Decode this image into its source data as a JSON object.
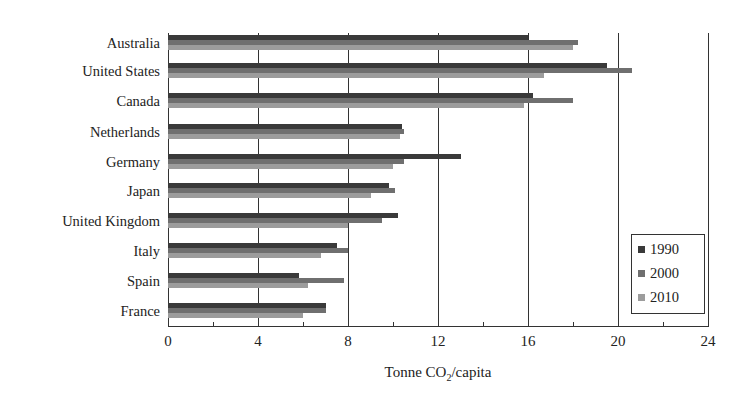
{
  "chart_data": {
    "type": "bar",
    "orientation": "horizontal",
    "title": "",
    "xlabel": "Tonne CO2/capita",
    "ylabel": "",
    "xlim": [
      0,
      24
    ],
    "xticks": [
      0,
      4,
      8,
      12,
      16,
      20,
      24
    ],
    "grid": "vertical",
    "legend_position": "lower right",
    "categories": [
      "Australia",
      "United States",
      "Canada",
      "Netherlands",
      "Germany",
      "Japan",
      "United Kingdom",
      "Italy",
      "Spain",
      "France"
    ],
    "series": [
      {
        "name": "1990",
        "color": "#3a3a3a",
        "values": [
          16.0,
          19.5,
          16.2,
          10.4,
          13.0,
          9.8,
          10.2,
          7.5,
          5.8,
          7.0
        ]
      },
      {
        "name": "2000",
        "color": "#6f6f6f",
        "values": [
          18.2,
          20.6,
          18.0,
          10.5,
          10.5,
          10.1,
          9.5,
          8.0,
          7.8,
          7.0
        ]
      },
      {
        "name": "2010",
        "color": "#9c9c9c",
        "values": [
          18.0,
          16.7,
          15.8,
          10.3,
          10.0,
          9.0,
          8.0,
          6.8,
          6.2,
          6.0
        ]
      }
    ]
  },
  "axis": {
    "xlabel_main": "Tonne CO",
    "xlabel_sub": "2",
    "xlabel_tail": "/capita",
    "ticks": [
      "0",
      "4",
      "8",
      "12",
      "16",
      "20",
      "24"
    ]
  },
  "legend": {
    "items": [
      "1990",
      "2000",
      "2010"
    ]
  }
}
